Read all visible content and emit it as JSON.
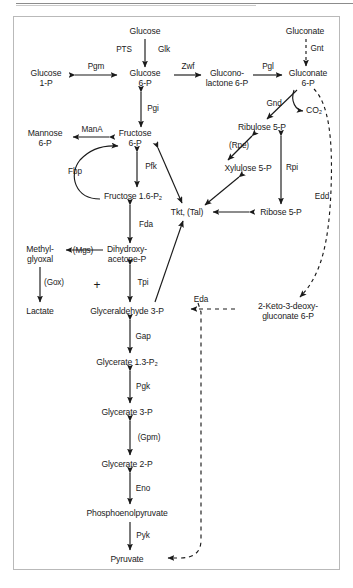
{
  "figure": {
    "caption": "",
    "border_color": "#b9b9b9",
    "text_color": "#1a1a1a",
    "line_color": "#1a1a1a"
  },
  "metabolites": [
    {
      "id": "glucose-ext",
      "label": "Glucose",
      "x": 145,
      "y": 31
    },
    {
      "id": "glucose-1p",
      "label": "Glucose\n1-P",
      "x": 46,
      "y": 78
    },
    {
      "id": "glucose-6p",
      "label": "Glucose\n6-P",
      "x": 145,
      "y": 78
    },
    {
      "id": "gluconolactone-6p",
      "label": "Glucono-\nlactone 6-P",
      "x": 227,
      "y": 78
    },
    {
      "id": "gluconate-6p",
      "label": "Gluconate\n6-P",
      "x": 308,
      "y": 78
    },
    {
      "id": "gluconate-ext",
      "label": "Gluconate",
      "x": 305,
      "y": 31
    },
    {
      "id": "co2",
      "label": "CO₂",
      "x": 314,
      "y": 110
    },
    {
      "id": "ribulose-5p",
      "label": "Ribulose 5-P",
      "x": 262,
      "y": 127
    },
    {
      "id": "xylulose-5p",
      "label": "Xylulose 5-P",
      "x": 248,
      "y": 168
    },
    {
      "id": "ribose-5p",
      "label": "Ribose 5-P",
      "x": 281,
      "y": 212
    },
    {
      "id": "tkt-tal",
      "label": "Tkt, (Tal)",
      "x": 187,
      "y": 212
    },
    {
      "id": "mannose-6p",
      "label": "Mannose\n6-P",
      "x": 45,
      "y": 138
    },
    {
      "id": "fructose-6p",
      "label": "Fructose\n6-P",
      "x": 135,
      "y": 138
    },
    {
      "id": "fructose-16p2",
      "label": "Fructose 1.6-P₂",
      "x": 133,
      "y": 196
    },
    {
      "id": "dihydroxyacetone-p",
      "label": "Dihydroxy-\nacetone-P",
      "x": 127,
      "y": 254
    },
    {
      "id": "methylglyoxal",
      "label": "Methyl-\nglyoxal",
      "x": 40,
      "y": 254
    },
    {
      "id": "lactate",
      "label": "Lactate",
      "x": 40,
      "y": 311
    },
    {
      "id": "glyceraldehyde-3p",
      "label": "Glyceraldehyde 3-P",
      "x": 127,
      "y": 311
    },
    {
      "id": "keto-deoxy-gluconate-6p",
      "label": "2-Keto-3-deoxy-\ngluconate 6-P",
      "x": 288,
      "y": 311
    },
    {
      "id": "glycerate-13p2",
      "label": "Glycerate 1.3-P₂",
      "x": 127,
      "y": 362
    },
    {
      "id": "glycerate-3p",
      "label": "Glycerate 3-P",
      "x": 127,
      "y": 412
    },
    {
      "id": "glycerate-2p",
      "label": "Glycerate 2-P",
      "x": 127,
      "y": 464
    },
    {
      "id": "phosphoenolpyruvate",
      "label": "Phosphoenolpyruvate",
      "x": 127,
      "y": 513
    },
    {
      "id": "pyruvate",
      "label": "Pyruvate",
      "x": 127,
      "y": 559
    }
  ],
  "enzymes": [
    {
      "id": "pts",
      "label": "PTS",
      "x": 124,
      "y": 50
    },
    {
      "id": "glk",
      "label": "Glk",
      "x": 164,
      "y": 50
    },
    {
      "id": "pgm",
      "label": "Pgm",
      "x": 96,
      "y": 67
    },
    {
      "id": "zwf",
      "label": "Zwf",
      "x": 188,
      "y": 67
    },
    {
      "id": "pgl",
      "label": "Pgl",
      "x": 268,
      "y": 67
    },
    {
      "id": "gnt",
      "label": "Gnt",
      "x": 317,
      "y": 49
    },
    {
      "id": "gnd",
      "label": "Gnd",
      "x": 274,
      "y": 104
    },
    {
      "id": "rpe",
      "label": "(Rpe)",
      "x": 239,
      "y": 146
    },
    {
      "id": "rpi",
      "label": "Rpi",
      "x": 292,
      "y": 168
    },
    {
      "id": "edd",
      "label": "Edd",
      "x": 322,
      "y": 197
    },
    {
      "id": "mana",
      "label": "ManA",
      "x": 92,
      "y": 130
    },
    {
      "id": "pgi",
      "label": "Pgi",
      "x": 153,
      "y": 109
    },
    {
      "id": "pfk",
      "label": "Pfk",
      "x": 151,
      "y": 167
    },
    {
      "id": "fbp",
      "label": "Fbp",
      "x": 75,
      "y": 172
    },
    {
      "id": "fda",
      "label": "Fda",
      "x": 146,
      "y": 225
    },
    {
      "id": "mgs",
      "label": "(Mgs)",
      "x": 83,
      "y": 251
    },
    {
      "id": "gox",
      "label": "(Gox)",
      "x": 54,
      "y": 283
    },
    {
      "id": "tpi",
      "label": "Tpi",
      "x": 143,
      "y": 283
    },
    {
      "id": "eda",
      "label": "Eda",
      "x": 201,
      "y": 300
    },
    {
      "id": "gap",
      "label": "Gap",
      "x": 143,
      "y": 337
    },
    {
      "id": "pgk",
      "label": "Pgk",
      "x": 143,
      "y": 387
    },
    {
      "id": "gpm",
      "label": "(Gpm)",
      "x": 149,
      "y": 438
    },
    {
      "id": "eno",
      "label": "Eno",
      "x": 143,
      "y": 489
    },
    {
      "id": "pyk",
      "label": "Pyk",
      "x": 143,
      "y": 536
    }
  ],
  "symbols": [
    {
      "id": "plus-triose",
      "label": "+",
      "x": 97,
      "y": 285
    }
  ],
  "edges": [
    {
      "id": "glucose-to-g6p",
      "from": "glucose-ext",
      "to": "glucose-6p",
      "style": "solid",
      "arrows": "single"
    },
    {
      "id": "g1p-g6p",
      "from": "glucose-1p",
      "to": "glucose-6p",
      "style": "solid",
      "arrows": "double"
    },
    {
      "id": "g6p-to-gl6p",
      "from": "glucose-6p",
      "to": "gluconolactone-6p",
      "style": "solid",
      "arrows": "single"
    },
    {
      "id": "gl6p-to-gnt6p",
      "from": "gluconolactone-6p",
      "to": "gluconate-6p",
      "style": "solid",
      "arrows": "single"
    },
    {
      "id": "gluconate-to-gnt6p",
      "from": "gluconate-ext",
      "to": "gluconate-6p",
      "style": "dashed",
      "arrows": "single"
    },
    {
      "id": "gnt6p-to-ru5p",
      "from": "gluconate-6p",
      "to": "ribulose-5p",
      "style": "solid",
      "arrows": "single"
    },
    {
      "id": "gnt6p-to-co2",
      "from": "gluconate-6p",
      "to": "co2",
      "style": "solid",
      "arrows": "single"
    },
    {
      "id": "gnt6p-to-kdg6p",
      "from": "gluconate-6p",
      "to": "keto-deoxy-gluconate-6p",
      "style": "dashed",
      "arrows": "single"
    },
    {
      "id": "ru5p-xu5p",
      "from": "ribulose-5p",
      "to": "xylulose-5p",
      "style": "solid",
      "arrows": "double"
    },
    {
      "id": "ru5p-r5p",
      "from": "ribulose-5p",
      "to": "ribose-5p",
      "style": "solid",
      "arrows": "double"
    },
    {
      "id": "xu5p-tkt",
      "from": "xylulose-5p",
      "to": "tkt-tal",
      "style": "solid",
      "arrows": "double"
    },
    {
      "id": "r5p-tkt",
      "from": "ribose-5p",
      "to": "tkt-tal",
      "style": "solid",
      "arrows": "double"
    },
    {
      "id": "f6p-tkt",
      "from": "fructose-6p",
      "to": "tkt-tal",
      "style": "solid",
      "arrows": "double"
    },
    {
      "id": "g3p-tkt",
      "from": "glyceraldehyde-3p",
      "to": "tkt-tal",
      "style": "solid",
      "arrows": "single"
    },
    {
      "id": "g6p-f6p",
      "from": "glucose-6p",
      "to": "fructose-6p",
      "style": "solid",
      "arrows": "double"
    },
    {
      "id": "f6p-mannose",
      "from": "fructose-6p",
      "to": "mannose-6p",
      "style": "solid",
      "arrows": "double"
    },
    {
      "id": "f6p-fbp16",
      "from": "fructose-6p",
      "to": "fructose-16p2",
      "style": "solid",
      "arrows": "double"
    },
    {
      "id": "fbp16-to-f6p-curve",
      "from": "fructose-16p2",
      "to": "fructose-6p",
      "style": "solid",
      "arrows": "single"
    },
    {
      "id": "fbp16-dhap",
      "from": "fructose-16p2",
      "to": "dihydroxyacetone-p",
      "style": "solid",
      "arrows": "double"
    },
    {
      "id": "dhap-methylglyoxal",
      "from": "dihydroxyacetone-p",
      "to": "methylglyoxal",
      "style": "solid",
      "arrows": "single"
    },
    {
      "id": "methylglyoxal-lactate",
      "from": "methylglyoxal",
      "to": "lactate",
      "style": "solid",
      "arrows": "single"
    },
    {
      "id": "dhap-g3p",
      "from": "dihydroxyacetone-p",
      "to": "glyceraldehyde-3p",
      "style": "solid",
      "arrows": "double"
    },
    {
      "id": "kdg6p-to-g3p",
      "from": "keto-deoxy-gluconate-6p",
      "to": "glyceraldehyde-3p",
      "style": "dashed",
      "arrows": "single"
    },
    {
      "id": "eda-to-pyruvate",
      "from": "keto-deoxy-gluconate-6p",
      "to": "pyruvate",
      "style": "dashed",
      "arrows": "single"
    },
    {
      "id": "g3p-g13p2",
      "from": "glyceraldehyde-3p",
      "to": "glycerate-13p2",
      "style": "solid",
      "arrows": "double"
    },
    {
      "id": "g13p2-g3pg",
      "from": "glycerate-13p2",
      "to": "glycerate-3p",
      "style": "solid",
      "arrows": "double"
    },
    {
      "id": "g3pg-g2pg",
      "from": "glycerate-3p",
      "to": "glycerate-2p",
      "style": "solid",
      "arrows": "double"
    },
    {
      "id": "g2pg-pep",
      "from": "glycerate-2p",
      "to": "phosphoenolpyruvate",
      "style": "solid",
      "arrows": "double"
    },
    {
      "id": "pep-pyruvate",
      "from": "phosphoenolpyruvate",
      "to": "pyruvate",
      "style": "solid",
      "arrows": "single"
    }
  ]
}
